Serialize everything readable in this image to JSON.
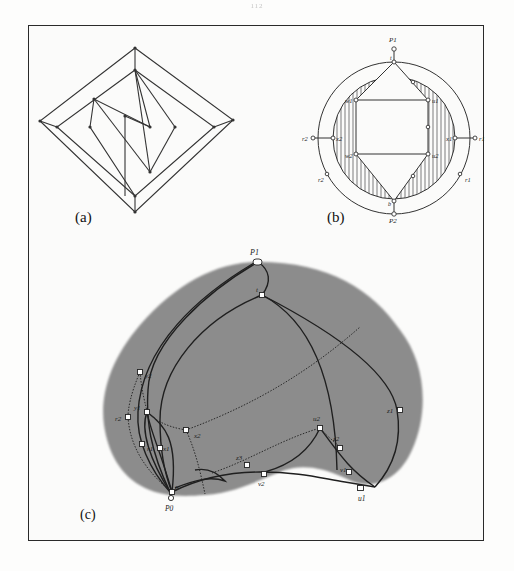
{
  "page": {
    "page_number": "112"
  },
  "figure": {
    "panels": [
      {
        "id": "a",
        "caption": "(a)",
        "description": "Nested diamond graph with zig-zag inner edges"
      },
      {
        "id": "b",
        "caption": "(b)",
        "description": "Concentric circles with hatched annulus and hexagonal inner structure",
        "labels": {
          "p1": "P1",
          "p2": "P2",
          "t": "t",
          "b": "b",
          "w1": "w1",
          "u1": "u1",
          "w2": "w2",
          "u2": "u2",
          "r2_left": "r2",
          "x2_left": "x2",
          "x1_right": "x1",
          "r1_right": "r1",
          "r2_bottom": "r2",
          "r1_bottom": "r1"
        }
      },
      {
        "id": "c",
        "caption": "(c)",
        "description": "Shaded heart-shaped region with curved edges and dotted paths",
        "labels": {
          "p1": "P1",
          "t": "t",
          "y2": "y2",
          "y1": "y1",
          "r2": "r2",
          "r1": "r1",
          "x1": "x1",
          "x2": "x2",
          "z3": "z3",
          "b": "b",
          "p0": "P0",
          "v2": "v2",
          "u2": "u2",
          "z2": "z2",
          "v1": "v1",
          "u1": "u1",
          "z1": "z1"
        }
      }
    ]
  },
  "colors": {
    "ink": "#222222",
    "shade": "#8c8c8c",
    "frame": "#2a2a2a",
    "paper": "#fbfbfa"
  }
}
